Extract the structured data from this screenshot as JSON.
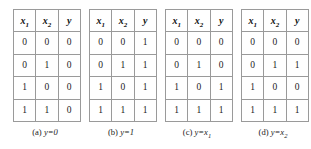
{
  "figure": {
    "columns": [
      "x",
      "x",
      "y"
    ],
    "header_labels": [
      {
        "base": "x",
        "sub": "1"
      },
      {
        "base": "x",
        "sub": "2"
      },
      {
        "base": "y",
        "sub": ""
      }
    ],
    "tables": [
      {
        "id": "table-a",
        "caption_label": "(a)",
        "caption_expr_base": "y=0",
        "caption_expr_sub": "",
        "rows": [
          [
            "0",
            "0",
            "0"
          ],
          [
            "0",
            "1",
            "0"
          ],
          [
            "1",
            "0",
            "0"
          ],
          [
            "1",
            "1",
            "0"
          ]
        ]
      },
      {
        "id": "table-b",
        "caption_label": "(b)",
        "caption_expr_base": "y=1",
        "caption_expr_sub": "",
        "rows": [
          [
            "0",
            "0",
            "1"
          ],
          [
            "0",
            "1",
            "1"
          ],
          [
            "1",
            "0",
            "1"
          ],
          [
            "1",
            "1",
            "1"
          ]
        ]
      },
      {
        "id": "table-c",
        "caption_label": "(c)",
        "caption_expr_base": "y=x",
        "caption_expr_sub": "1",
        "rows": [
          [
            "0",
            "0",
            "0"
          ],
          [
            "0",
            "1",
            "0"
          ],
          [
            "1",
            "0",
            "1"
          ],
          [
            "1",
            "1",
            "1"
          ]
        ]
      },
      {
        "id": "table-d",
        "caption_label": "(d)",
        "caption_expr_base": "y=x",
        "caption_expr_sub": "2",
        "rows": [
          [
            "0",
            "0",
            "0"
          ],
          [
            "0",
            "1",
            "1"
          ],
          [
            "1",
            "0",
            "0"
          ],
          [
            "1",
            "1",
            "1"
          ]
        ]
      }
    ],
    "colors": {
      "border": "#9a9a9a",
      "text": "#1a1a1a",
      "background": "#ffffff"
    }
  }
}
